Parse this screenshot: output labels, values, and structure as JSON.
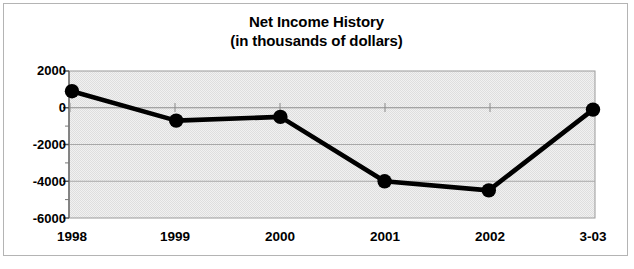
{
  "chart_data": {
    "type": "line",
    "title": "Net Income History",
    "subtitle": "(in thousands of dollars)",
    "xlabel": "",
    "ylabel": "",
    "categories": [
      "1998",
      "1999",
      "2000",
      "2001",
      "2002",
      "3-03"
    ],
    "values": [
      900,
      -700,
      -500,
      -4000,
      -4500,
      -100
    ],
    "series": [
      {
        "name": "Net Income",
        "values": [
          900,
          -700,
          -500,
          -4000,
          -4500,
          -100
        ]
      }
    ],
    "ylim": [
      -6000,
      2000
    ],
    "ytick_labels": [
      "2000",
      "0",
      "-2000",
      "-4000",
      "-6000"
    ],
    "ytick_values": [
      2000,
      0,
      -2000,
      -4000,
      -6000
    ],
    "yminor_step": 1000,
    "grid": true,
    "grid_axis": "y",
    "legend": "none",
    "marker": "filled-circle",
    "line_color": "#000000",
    "marker_color": "#000000",
    "plot_background": "#ededed",
    "gridline_color": "#909090",
    "frame_color": "#b4b4b4"
  },
  "title": {
    "line1": "Net Income History",
    "line2": "(in thousands of dollars)"
  },
  "axes": {
    "y_ticks": [
      "2000",
      "0",
      "-2000",
      "-4000",
      "-6000"
    ],
    "x_ticks": [
      "1998",
      "1999",
      "2000",
      "2001",
      "2002",
      "3-03"
    ]
  }
}
